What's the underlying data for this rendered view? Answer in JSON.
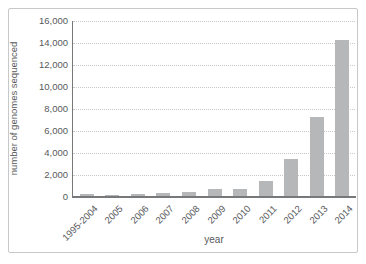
{
  "chart_data": {
    "type": "bar",
    "title": "",
    "xlabel": "year",
    "ylabel": "number of genomes sequenced",
    "categories": [
      "1995-2004",
      "2005",
      "2006",
      "2007",
      "2008",
      "2009",
      "2010",
      "2011",
      "2012",
      "2013",
      "2014"
    ],
    "values": [
      250,
      150,
      250,
      400,
      500,
      750,
      750,
      1500,
      3500,
      7300,
      14300
    ],
    "ylim": [
      0,
      16000
    ],
    "ytick_interval": 2000,
    "ytick_labels": [
      "0",
      "2,000",
      "4,000",
      "6,000",
      "8,000",
      "10,000",
      "12,000",
      "14,000",
      "16,000"
    ],
    "grid": "horizontal-dotted",
    "legend": "none",
    "bar_color": "#b6b7b9",
    "axis_color": "#77787a",
    "gridline_color": "#c6c7c9",
    "text_color": "#58595b",
    "frame_border_color": "#c7c8ca"
  }
}
